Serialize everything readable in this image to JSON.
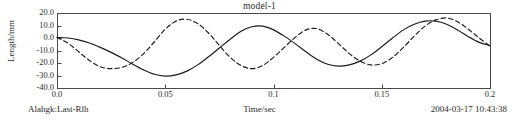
{
  "chart_data": {
    "type": "line",
    "title": "model-1",
    "xlabel": "Time/sec",
    "ylabel": "Length/mm",
    "xlim": [
      0.0,
      0.2
    ],
    "ylim": [
      -40.0,
      20.0
    ],
    "grid": false,
    "legend": "none",
    "xticks": [
      "0.0",
      "0.05",
      "0.1",
      "0.15",
      "0.2"
    ],
    "xtick_values": [
      0.0,
      0.05,
      0.1,
      0.15,
      0.2
    ],
    "yticks": [
      "20.0",
      "10.0",
      "0.0",
      "-10.0",
      "-20.0",
      "-30.0",
      "-40.0"
    ],
    "ytick_values": [
      20.0,
      10.0,
      0.0,
      -10.0,
      -20.0,
      -30.0,
      -40.0
    ],
    "series": [
      {
        "name": "solid",
        "style": "solid",
        "color": "#1a1a1a",
        "x": [
          0.0,
          0.005,
          0.01,
          0.015,
          0.02,
          0.025,
          0.03,
          0.035,
          0.04,
          0.045,
          0.05,
          0.055,
          0.06,
          0.065,
          0.07,
          0.075,
          0.08,
          0.085,
          0.09,
          0.095,
          0.1,
          0.105,
          0.11,
          0.115,
          0.12,
          0.125,
          0.13,
          0.135,
          0.14,
          0.145,
          0.15,
          0.155,
          0.16,
          0.165,
          0.17,
          0.175,
          0.18,
          0.185,
          0.19,
          0.195,
          0.2
        ],
        "y": [
          0.5,
          0.0,
          -1.5,
          -4.0,
          -7.5,
          -11.5,
          -16.0,
          -21.0,
          -25.5,
          -29.0,
          -30.5,
          -29.5,
          -26.5,
          -21.5,
          -15.0,
          -8.0,
          -1.0,
          5.5,
          9.0,
          9.5,
          6.5,
          1.5,
          -4.5,
          -11.0,
          -17.0,
          -21.0,
          -22.5,
          -21.5,
          -18.5,
          -13.5,
          -7.0,
          0.0,
          6.5,
          11.0,
          13.5,
          13.5,
          11.0,
          6.5,
          1.0,
          -3.5,
          -6.0
        ]
      },
      {
        "name": "dashed",
        "style": "dashed",
        "color": "#1a1a1a",
        "x": [
          0.0,
          0.005,
          0.01,
          0.015,
          0.02,
          0.025,
          0.03,
          0.035,
          0.04,
          0.045,
          0.05,
          0.055,
          0.06,
          0.065,
          0.07,
          0.075,
          0.08,
          0.085,
          0.09,
          0.095,
          0.1,
          0.105,
          0.11,
          0.115,
          0.12,
          0.125,
          0.13,
          0.135,
          0.14,
          0.145,
          0.15,
          0.155,
          0.16,
          0.165,
          0.17,
          0.175,
          0.18,
          0.185,
          0.19,
          0.195,
          0.2
        ],
        "y": [
          0.5,
          -4.0,
          -11.0,
          -18.0,
          -23.0,
          -24.5,
          -23.5,
          -19.5,
          -12.5,
          -3.0,
          7.0,
          13.5,
          15.0,
          11.5,
          4.0,
          -6.0,
          -15.5,
          -22.0,
          -24.5,
          -22.0,
          -15.5,
          -7.5,
          0.5,
          6.5,
          7.5,
          3.0,
          -4.5,
          -12.5,
          -18.5,
          -21.5,
          -20.5,
          -15.5,
          -7.5,
          1.5,
          9.5,
          14.5,
          16.0,
          13.0,
          7.0,
          0.0,
          -6.5
        ]
      }
    ]
  },
  "footer": {
    "left": "Alahgk:Last-Rlh",
    "right": "2004-03-17 10:43:38"
  },
  "colors": {
    "axis": "#4a4a4a",
    "curve": "#1a1a1a",
    "text": "#2b2b2b",
    "background": "#ffffff"
  }
}
